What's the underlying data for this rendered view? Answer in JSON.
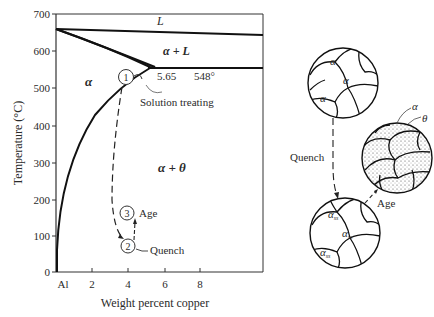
{
  "diagram": {
    "axes": {
      "ylabel": "Temperature (°C)",
      "xlabel": "Weight percent copper",
      "y_ticks": [
        "0",
        "100",
        "200",
        "300",
        "400",
        "500",
        "600",
        "700"
      ],
      "x_ticks": [
        "Al",
        "2",
        "4",
        "6",
        "8"
      ]
    },
    "phase_labels": {
      "liquid": "L",
      "alpha_plus_liquid": "α + L",
      "alpha": "α",
      "alpha_plus_theta": "α + θ"
    },
    "eutectic": {
      "composition": "5.65",
      "temperature": "548°"
    },
    "steps": [
      {
        "number": "1",
        "label": "Solution treating"
      },
      {
        "number": "2",
        "label": "Quench"
      },
      {
        "number": "3",
        "label": "Age"
      }
    ],
    "microstructures": {
      "top": {
        "grain_label": "α"
      },
      "middle": {
        "labels": [
          "α",
          "θ"
        ]
      },
      "bottom": {
        "grain_label": "α",
        "grain_subscript": "ss"
      },
      "arrows": {
        "quench": "Quench",
        "age": "Age"
      }
    },
    "colors": {
      "ink": "#1a1a1a",
      "background": "#ffffff"
    }
  }
}
